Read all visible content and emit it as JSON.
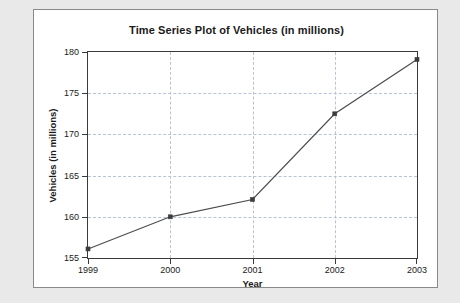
{
  "chart_data": {
    "type": "line",
    "title": "Time Series Plot of Vehicles (in millions)",
    "xlabel": "Year",
    "ylabel": "Vehicles (in millions)",
    "x": [
      1999,
      2000,
      2001,
      2002,
      2003
    ],
    "categories": [
      "1999",
      "2000",
      "2001",
      "2002",
      "2003"
    ],
    "values": [
      156.1,
      160.0,
      162.1,
      172.5,
      179.1
    ],
    "series": [
      {
        "name": "Vehicles (in millions)",
        "values": [
          156.1,
          160.0,
          162.1,
          172.5,
          179.1
        ]
      }
    ],
    "xlim": [
      1999,
      2003
    ],
    "ylim": [
      155,
      180
    ],
    "yticks": [
      155,
      160,
      165,
      170,
      175,
      180
    ],
    "ytick_labels": [
      "155",
      "160",
      "165",
      "170",
      "175",
      "180"
    ],
    "xticks": [
      1999,
      2000,
      2001,
      2002,
      2003
    ],
    "xtick_labels": [
      "1999",
      "2000",
      "2001",
      "2002",
      "2003"
    ],
    "grid": true,
    "grid_style": "dashed",
    "grid_color": "#b9c3d6",
    "legend": false,
    "legend_position": "none",
    "line_color": "#4d4d4d",
    "marker_color": "#3c3c3c",
    "marker_style": "square",
    "plot_background": "#ffffff",
    "figure_background": "#ffffff",
    "page_background": "#e9e9e9"
  }
}
